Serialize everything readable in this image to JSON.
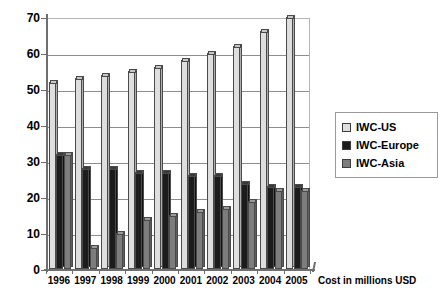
{
  "chart_data": {
    "type": "bar",
    "title": "",
    "subtitle": "",
    "xlabel": "Cost in millions USD",
    "ylabel": "",
    "ylim": [
      0,
      70
    ],
    "yticks": [
      0,
      10,
      20,
      30,
      40,
      50,
      60,
      70
    ],
    "grid": true,
    "legend_position": "right",
    "categories": [
      "1996",
      "1997",
      "1998",
      "1999",
      "2000",
      "2001",
      "2002",
      "2003",
      "2004",
      "2005"
    ],
    "series": [
      {
        "name": "IWC-US",
        "color": "#dedede",
        "values": [
          52,
          53,
          54,
          55,
          56,
          58,
          60,
          62,
          66,
          70
        ]
      },
      {
        "name": "IWC-Europe",
        "color": "#1c1c1c",
        "values": [
          32,
          28,
          28,
          27,
          27,
          26,
          26,
          24,
          23,
          23
        ]
      },
      {
        "name": "IWC-Asia",
        "color": "#7d7d7d",
        "values": [
          32,
          6,
          10,
          14,
          15,
          16,
          17,
          19,
          22,
          22
        ]
      }
    ]
  },
  "legend": {
    "items": [
      {
        "label": "IWC-US"
      },
      {
        "label": "IWC-Europe"
      },
      {
        "label": "IWC-Asia"
      }
    ]
  }
}
